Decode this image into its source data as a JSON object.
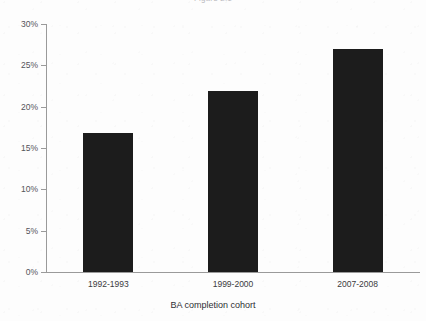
{
  "chart_data": {
    "type": "bar",
    "title": "",
    "subtitle": "",
    "xlabel": "BA completion cohort",
    "ylabel": "",
    "categories": [
      "1992-1993",
      "1999-2000",
      "2007-2008"
    ],
    "values": [
      16.8,
      21.9,
      27.0
    ],
    "value_labels": [
      "",
      "",
      ""
    ],
    "ylim": [
      0,
      30
    ],
    "ytick_values": [
      0,
      5,
      10,
      15,
      20,
      25,
      30
    ],
    "ytick_labels": [
      "0%",
      "5%",
      "10%",
      "15%",
      "20%",
      "25%",
      "30%"
    ],
    "grid": false,
    "legend": null,
    "legend_position": "none",
    "series": [
      {
        "name": "",
        "values": [
          16.8,
          21.9,
          27.0
        ]
      }
    ],
    "annotations": [],
    "colors": {
      "bar": "#1c1c1c",
      "axis": "#9a9a9a",
      "tick_text": "#54545a",
      "category_text": "#3b3b40",
      "axis_title_text": "#2e2e33",
      "background": "#fdfdfd",
      "clipped_title_text": "#b9b9bd"
    }
  },
  "figure": {
    "clipped_title_fragment": "Figure 2.1",
    "x_axis_title": "BA completion cohort"
  }
}
